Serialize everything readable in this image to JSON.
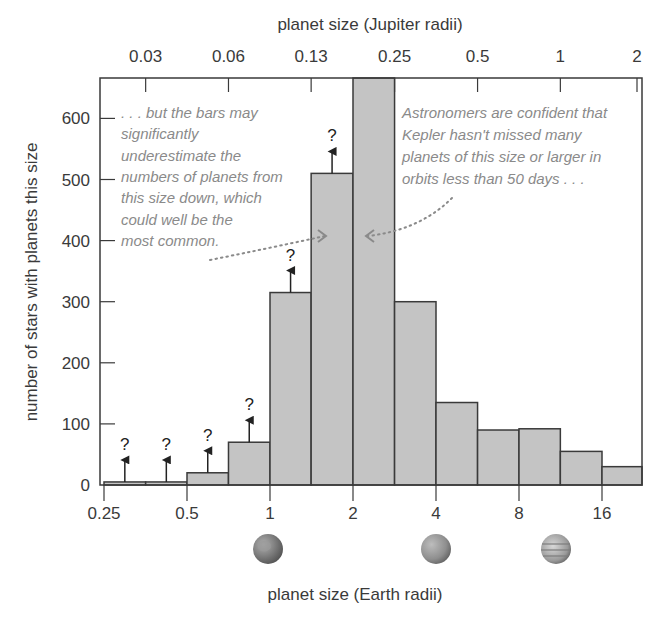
{
  "chart_data": {
    "type": "bar",
    "subtype": "histogram",
    "title": "",
    "xlabel": "planet size (Earth radii)",
    "x2label": "planet size (Jupiter radii)",
    "ylabel": "number of stars with planets this size",
    "x_scale": "log2",
    "bin_edges": [
      0.25,
      0.354,
      0.5,
      0.707,
      1,
      1.41,
      2,
      2.83,
      4,
      5.66,
      8,
      11.3,
      16,
      22.6
    ],
    "values": [
      5,
      5,
      20,
      70,
      315,
      510,
      680,
      300,
      135,
      90,
      92,
      55,
      30
    ],
    "clipped_bins": [
      6
    ],
    "lower_limit_bins": [
      0,
      1,
      2,
      3,
      4,
      5
    ],
    "lower_limit_marker": "?",
    "ylim": [
      0,
      680
    ],
    "yticks": [
      0,
      100,
      200,
      300,
      400,
      500,
      600
    ],
    "xticks": [
      {
        "value": 0.25,
        "label": "0.25"
      },
      {
        "value": 0.5,
        "label": "0.5"
      },
      {
        "value": 1,
        "label": "1"
      },
      {
        "value": 2,
        "label": "2"
      },
      {
        "value": 4,
        "label": "4"
      },
      {
        "value": 8,
        "label": "8"
      },
      {
        "value": 16,
        "label": "16"
      }
    ],
    "x2ticks": [
      {
        "value_earth": 0.354,
        "label": "0.03"
      },
      {
        "value_earth": 0.707,
        "label": "0.06"
      },
      {
        "value_earth": 1.41,
        "label": "0.13"
      },
      {
        "value_earth": 2.83,
        "label": "0.25"
      },
      {
        "value_earth": 5.66,
        "label": "0.5"
      },
      {
        "value_earth": 11.3,
        "label": "1"
      },
      {
        "value_earth": 22.6,
        "label": "2"
      }
    ],
    "grid": false,
    "legend": null,
    "annotations": [
      {
        "id": "left",
        "lines": [
          ". . . but the bars may",
          "significantly",
          "underestimate the",
          "numbers of planets from",
          "this size down, which",
          "could well be the",
          "most common."
        ],
        "points_to_bin": 5
      },
      {
        "id": "right",
        "lines": [
          "Astronomers are confident that",
          "Kepler hasn't missed many",
          "planets of this size or larger in",
          "orbits less than 50 days . . ."
        ],
        "points_to_bin": 6
      }
    ],
    "planet_icons": [
      {
        "name": "earth",
        "at_earth_radii": 1
      },
      {
        "name": "neptune",
        "at_earth_radii": 4
      },
      {
        "name": "jupiter",
        "at_earth_radii": 11
      }
    ]
  },
  "colors": {
    "bar_fill": "#c4c4c4",
    "bar_stroke": "#3a3a3a",
    "axis": "#3a3a3a",
    "annotation_text": "#8a8a8a",
    "background": "#ffffff"
  },
  "labels": {
    "x_bottom": "planet size (Earth radii)",
    "x_top": "planet size (Jupiter radii)",
    "y": "number of stars with planets this size"
  }
}
